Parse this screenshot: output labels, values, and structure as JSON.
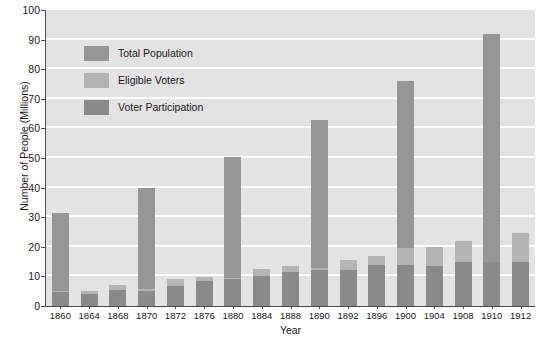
{
  "chart_data": {
    "type": "bar",
    "title": "",
    "xlabel": "Year",
    "ylabel": "Number of People (Millions)",
    "ylim": [
      0,
      100
    ],
    "ytick_step": 10,
    "yticks": [
      0,
      10,
      20,
      30,
      40,
      50,
      60,
      70,
      80,
      90,
      100
    ],
    "grid": true,
    "grid_axis": "y",
    "legend_position": "upper-left-inside",
    "stacking": "overlaid",
    "categories": [
      "1860",
      "1864",
      "1868",
      "1870",
      "1872",
      "1876",
      "1880",
      "1884",
      "1888",
      "1890",
      "1892",
      "1896",
      "1900",
      "1904",
      "1908",
      "1910",
      "1912"
    ],
    "series": [
      {
        "name": "Total Population",
        "color": "#969696",
        "values": [
          31.5,
          5.0,
          7.0,
          39.8,
          9.0,
          9.8,
          50.2,
          12.5,
          13.5,
          62.9,
          15.5,
          17.0,
          76.0,
          20.0,
          21.8,
          92.0,
          24.5
        ]
      },
      {
        "name": "Eligible Voters",
        "color": "#b4b4b4",
        "values": [
          5.0,
          5.0,
          7.0,
          5.6,
          9.0,
          9.8,
          9.5,
          12.5,
          13.5,
          13.0,
          15.5,
          17.0,
          19.5,
          20.0,
          21.8,
          15.0,
          24.5
        ]
      },
      {
        "name": "Voter Participation",
        "color": "#8a8a8a",
        "values": [
          4.6,
          4.0,
          5.5,
          5.0,
          6.6,
          8.5,
          9.2,
          10.1,
          11.4,
          12.0,
          12.0,
          13.9,
          13.9,
          13.5,
          14.9,
          14.9,
          15.0
        ]
      }
    ]
  },
  "legend": {
    "items": [
      {
        "label": "Total Population",
        "color": "#969696"
      },
      {
        "label": "Eligible Voters",
        "color": "#b4b4b4"
      },
      {
        "label": "Voter Participation",
        "color": "#8a8a8a"
      }
    ]
  },
  "colors": {
    "plot_background": "#e3e3e3",
    "gridline": "#ffffff",
    "axis": "#4a4a4a",
    "text": "#1a1a1a"
  }
}
